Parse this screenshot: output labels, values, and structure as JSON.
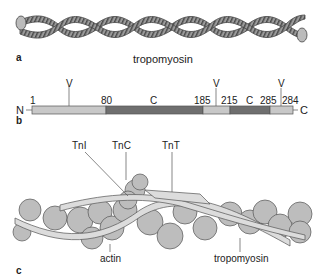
{
  "panels": {
    "a": {
      "letter": "a",
      "caption": "tropomyosin"
    },
    "b": {
      "letter": "b",
      "n_terminus": "N",
      "c_terminus": "C",
      "v_markers": [
        "V",
        "V",
        "V"
      ],
      "segments": [
        {
          "start": "1",
          "end": "80",
          "type": "",
          "color": "#c8c8c8"
        },
        {
          "start": "80",
          "end": "185",
          "type": "C",
          "color": "#6f6f6f"
        },
        {
          "start": "185",
          "end": "215",
          "type": "",
          "color": "#c8c8c8"
        },
        {
          "start": "215",
          "end": "285",
          "type": "C",
          "color": "#6f6f6f"
        },
        {
          "start": "285",
          "end": "284",
          "type": "",
          "color": "#c8c8c8"
        }
      ],
      "position_labels": [
        "1",
        "80",
        "C",
        "185",
        "215",
        "C",
        "285",
        "284"
      ]
    },
    "c": {
      "letter": "c",
      "labels": {
        "tni": "TnI",
        "tnc": "TnC",
        "tnt": "TnT",
        "actin": "actin",
        "tropomyosin": "tropomyosin"
      }
    }
  }
}
